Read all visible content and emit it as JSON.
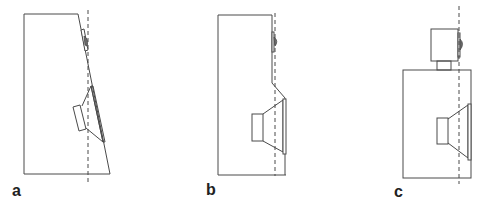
{
  "figure": {
    "colors": {
      "stroke": "#4a4a4a",
      "background": "#ffffff",
      "label": "#222222"
    },
    "panels": [
      {
        "label": "a",
        "variant": "sloped-baffle",
        "note": "Baffle tilted back so tweeter and woofer acoustic centers align with dashed plane"
      },
      {
        "label": "b",
        "variant": "stepped-baffle",
        "note": "Woofer section stepped forward relative to tweeter"
      },
      {
        "label": "c",
        "variant": "separate-tweeter-pod",
        "note": "Tweeter in separate enclosure on top, set back to align with woofer"
      }
    ],
    "legend": {
      "dashed_line": "reference plane",
      "components": [
        "cabinet",
        "woofer",
        "tweeter"
      ]
    }
  }
}
